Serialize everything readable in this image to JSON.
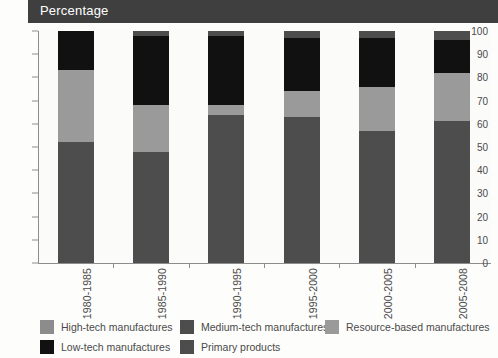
{
  "header": {
    "title": "Percentage"
  },
  "chart_data": {
    "type": "bar",
    "subtype": "stacked-bar-100",
    "title": "Percentage",
    "xlabel": "",
    "ylabel": "Percentage",
    "ylim": [
      0,
      100
    ],
    "ytick_labels": [
      "0",
      "10",
      "20",
      "30",
      "40",
      "50",
      "60",
      "70",
      "80",
      "90",
      "100"
    ],
    "yticks": [
      0,
      10,
      20,
      30,
      40,
      50,
      60,
      70,
      80,
      90,
      100
    ],
    "grid": false,
    "legend_position": "bottom",
    "categories": [
      "1980-1985",
      "1985-1990",
      "1990-1995",
      "1995-2000",
      "2000-2005",
      "2005-2008"
    ],
    "series": [
      {
        "name": "Primary products",
        "color": "#4d4d4d",
        "values": [
          52,
          48,
          64,
          63,
          57,
          61
        ]
      },
      {
        "name": "Resource-based manufactures",
        "color": "#9a9a9a",
        "values": [
          31,
          20,
          4,
          11,
          19,
          21
        ]
      },
      {
        "name": "Low-tech manufactures",
        "color": "#111111",
        "values": [
          17,
          30,
          30,
          23,
          21,
          14
        ]
      },
      {
        "name": "Medium-tech manufactures",
        "color": "#4d4d4d",
        "values": [
          0,
          2,
          2,
          3,
          3,
          4
        ]
      },
      {
        "name": "High-tech manufactures",
        "color": "#8c8c8c",
        "values": [
          0,
          0,
          0,
          0,
          0,
          0
        ]
      }
    ]
  },
  "legend": {
    "items": [
      {
        "label": "High-tech manufactures",
        "color": "#8c8c8c"
      },
      {
        "label": "Medium-tech manufactures",
        "color": "#4d4d4d"
      },
      {
        "label": "Resource-based manufactures",
        "color": "#9a9a9a"
      },
      {
        "label": "Low-tech manufactures",
        "color": "#111111"
      },
      {
        "label": "Primary products",
        "color": "#4d4d4d"
      }
    ]
  },
  "colors": {
    "banner": "#3f3f3f",
    "banner_text": "#ffffff",
    "axis": "#8d8d8d",
    "plot_background": "#fbfbf9",
    "page_background": "#fdfdfb"
  }
}
